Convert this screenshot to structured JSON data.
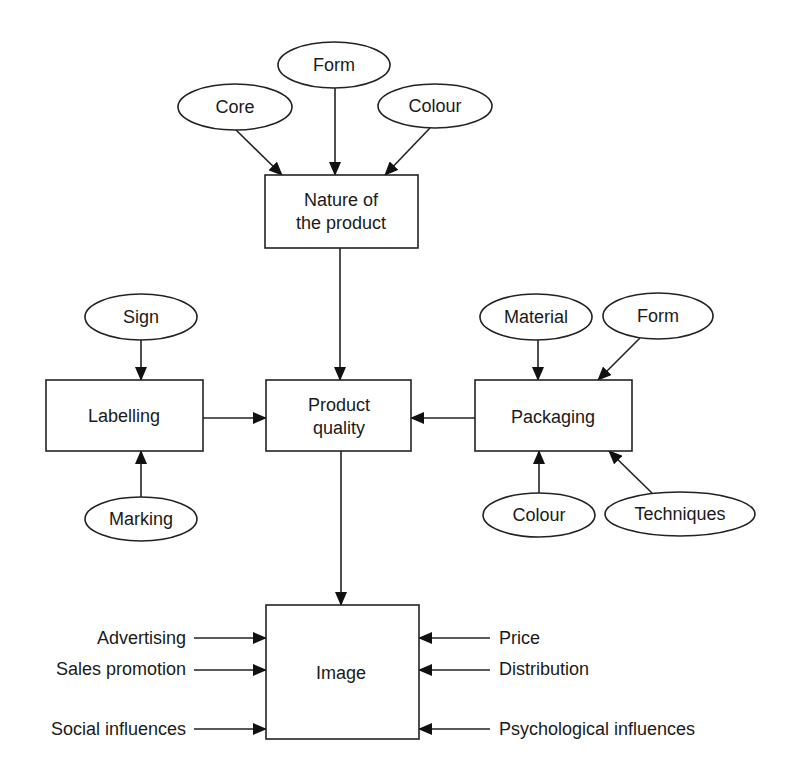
{
  "diagram": {
    "type": "flow",
    "colors": {
      "stroke": "#222222",
      "background": "#ffffff",
      "text": "#1a1a1a"
    },
    "nodes": {
      "core": {
        "label": "Core",
        "shape": "ellipse"
      },
      "form_top": {
        "label": "Form",
        "shape": "ellipse"
      },
      "colour_top": {
        "label": "Colour",
        "shape": "ellipse"
      },
      "nature": {
        "label_line1": "Nature of",
        "label_line2": "the product",
        "shape": "rectangle"
      },
      "sign": {
        "label": "Sign",
        "shape": "ellipse"
      },
      "labelling": {
        "label": "Labelling",
        "shape": "rectangle"
      },
      "marking": {
        "label": "Marking",
        "shape": "ellipse"
      },
      "quality": {
        "label_line1": "Product",
        "label_line2": "quality",
        "shape": "rectangle"
      },
      "material": {
        "label": "Material",
        "shape": "ellipse"
      },
      "form_pkg": {
        "label": "Form",
        "shape": "ellipse"
      },
      "packaging": {
        "label": "Packaging",
        "shape": "rectangle"
      },
      "colour_pkg": {
        "label": "Colour",
        "shape": "ellipse"
      },
      "techniques": {
        "label": "Techniques",
        "shape": "ellipse"
      },
      "image": {
        "label": "Image",
        "shape": "rectangle"
      }
    },
    "image_inputs": {
      "left": [
        "Advertising",
        "Sales promotion",
        "Social influences"
      ],
      "right": [
        "Price",
        "Distribution",
        "Psychological influences"
      ]
    },
    "edges": [
      {
        "from": "Core",
        "to": "Nature of the product"
      },
      {
        "from": "Form",
        "to": "Nature of the product"
      },
      {
        "from": "Colour",
        "to": "Nature of the product"
      },
      {
        "from": "Nature of the product",
        "to": "Product quality"
      },
      {
        "from": "Sign",
        "to": "Labelling"
      },
      {
        "from": "Marking",
        "to": "Labelling"
      },
      {
        "from": "Labelling",
        "to": "Product quality"
      },
      {
        "from": "Material",
        "to": "Packaging"
      },
      {
        "from": "Form",
        "to": "Packaging"
      },
      {
        "from": "Colour",
        "to": "Packaging"
      },
      {
        "from": "Techniques",
        "to": "Packaging"
      },
      {
        "from": "Packaging",
        "to": "Product quality"
      },
      {
        "from": "Product quality",
        "to": "Image"
      },
      {
        "from": "Advertising",
        "to": "Image"
      },
      {
        "from": "Sales promotion",
        "to": "Image"
      },
      {
        "from": "Social influences",
        "to": "Image"
      },
      {
        "from": "Price",
        "to": "Image"
      },
      {
        "from": "Distribution",
        "to": "Image"
      },
      {
        "from": "Psychological influences",
        "to": "Image"
      }
    ]
  }
}
